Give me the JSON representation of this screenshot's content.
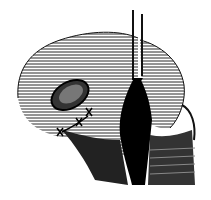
{
  "image": {
    "subject": "anatomical line drawing",
    "description": "Engraved illustration of a rounded joint surface with an oval defect, sutures, and a central dark cleft with an instrument",
    "colors": {
      "background": "#ffffff",
      "ink": "#111111"
    }
  }
}
